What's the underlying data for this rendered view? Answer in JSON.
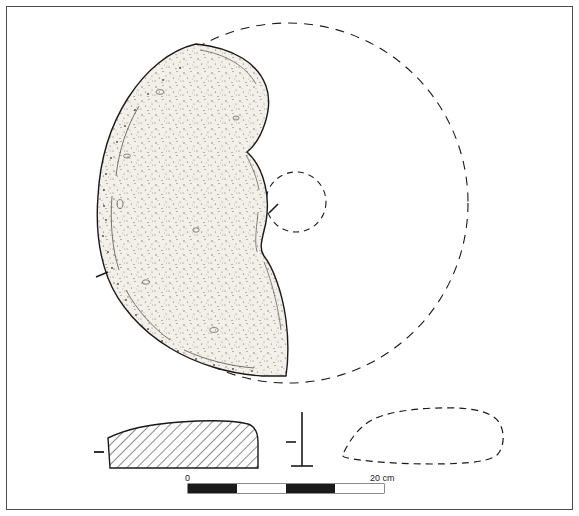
{
  "figure": {
    "type": "archaeological-artifact-drawing",
    "border_color": "#4d4d4d",
    "outline_color": "#1a1a1a",
    "fill_color": "#f2efe9",
    "background_color": "#ffffff"
  },
  "plan_view": {
    "name": "plan-view",
    "reconstructed_circle": {
      "center_x": 288,
      "center_y": 203,
      "radius": 180,
      "style": "dashed"
    },
    "central_perforation": {
      "center_x": 296,
      "center_y": 202,
      "radius": 30,
      "style": "dashed"
    },
    "fragment_description": "surviving sherd occupying the left-hand sector of the disc, stippled surface texture",
    "tick_marks": [
      {
        "name": "section-tick-left",
        "x": 101,
        "y": 275
      },
      {
        "name": "section-tick-center",
        "x": 273,
        "y": 209
      }
    ]
  },
  "profile_view": {
    "name": "profile-section",
    "hatched": true,
    "hatch_angle_deg": 45,
    "tick_mark": {
      "name": "profile-tick-left",
      "x": 98,
      "y": 452
    },
    "axis_marker": {
      "name": "section-axis-marker",
      "x": 302,
      "y": 415
    }
  },
  "reconstruction_profile": {
    "name": "reconstructed-profile-section",
    "style": "dashed"
  },
  "scale_bar": {
    "name": "scale-bar",
    "labels": {
      "min": "0",
      "max": "20 cm"
    },
    "segments": 4,
    "segment_colors": [
      "#1a1a1a",
      "#ffffff",
      "#1a1a1a",
      "#ffffff"
    ],
    "x": 188,
    "y": 484,
    "width": 196,
    "height": 9
  }
}
